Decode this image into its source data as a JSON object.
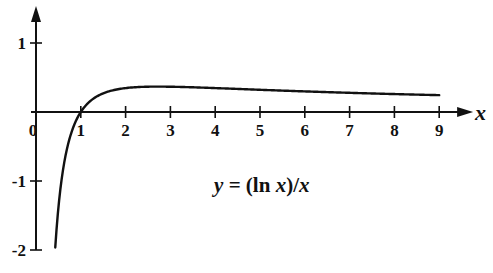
{
  "chart_data": {
    "type": "line",
    "title": "",
    "annotation": {
      "text_parts": [
        [
          "y",
          true
        ],
        [
          " = (ln ",
          false
        ],
        [
          "x",
          true
        ],
        [
          ")/",
          false
        ],
        [
          "x",
          true
        ]
      ],
      "x": 4.6,
      "y": -1.05
    },
    "xlabel": "x",
    "ylabel": "",
    "xlim": [
      0,
      9.4
    ],
    "ylim": [
      -2,
      1.5
    ],
    "xticks": [
      0,
      1,
      2,
      3,
      4,
      5,
      6,
      7,
      8,
      9
    ],
    "xtick_labels": [
      "0",
      "1",
      "2",
      "3",
      "4",
      "5",
      "6",
      "7",
      "8",
      "9"
    ],
    "yticks": [
      1,
      -1,
      -2
    ],
    "ytick_labels": [
      "1",
      "-1",
      "-2"
    ],
    "grid": false,
    "legend": null,
    "series": [
      {
        "name": "y = (ln x)/x",
        "function": "ln(x)/x",
        "domain": [
          0.43,
          9
        ],
        "x": [
          0.43,
          0.5,
          0.6,
          0.7,
          0.8,
          0.9,
          1,
          1.25,
          1.5,
          2,
          2.5,
          2.718,
          3,
          4,
          5,
          6,
          7,
          8,
          9
        ],
        "values": [
          -1.96,
          -1.386,
          -0.851,
          -0.51,
          -0.279,
          -0.117,
          0,
          0.179,
          0.27,
          0.347,
          0.367,
          0.368,
          0.366,
          0.347,
          0.322,
          0.299,
          0.278,
          0.26,
          0.244
        ]
      }
    ]
  },
  "layout": {
    "origin_px": [
      36,
      112
    ],
    "x_unit_px": 44.8,
    "y_unit_px": 69,
    "colors": {
      "ink": "#111111",
      "background": "#ffffff"
    }
  }
}
